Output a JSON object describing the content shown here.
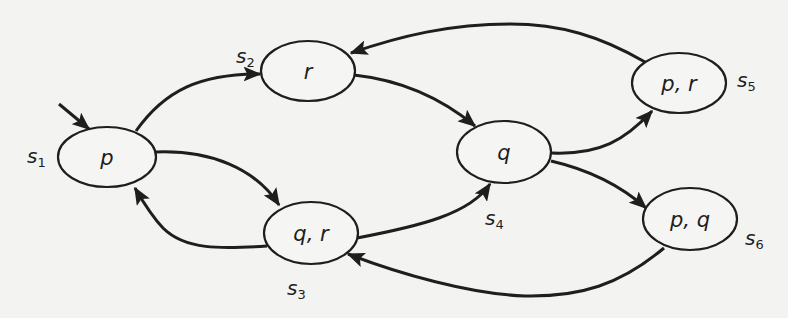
{
  "diagram": {
    "type": "kripke-structure",
    "colors": {
      "background": "#f3f3f1",
      "stroke": "#1e1e1e",
      "node_fill": "#f5f5f3"
    },
    "initial_state": "s1",
    "states": [
      {
        "id": "s1",
        "name": "s",
        "index": "1",
        "props": "p",
        "cx": 107,
        "cy": 157,
        "rx": 49,
        "ry": 30,
        "label_x": 27,
        "label_y": 163
      },
      {
        "id": "s2",
        "name": "s",
        "index": "2",
        "props": "r",
        "cx": 308,
        "cy": 71,
        "rx": 47,
        "ry": 30,
        "label_x": 236,
        "label_y": 64
      },
      {
        "id": "s3",
        "name": "s",
        "index": "3",
        "props": "q, r",
        "cx": 311,
        "cy": 233,
        "rx": 47,
        "ry": 31,
        "label_x": 287,
        "label_y": 297
      },
      {
        "id": "s4",
        "name": "s",
        "index": "4",
        "props": "q",
        "cx": 504,
        "cy": 152,
        "rx": 47,
        "ry": 31,
        "label_x": 485,
        "label_y": 227
      },
      {
        "id": "s5",
        "name": "s",
        "index": "5",
        "props": "p, r",
        "cx": 679,
        "cy": 83,
        "rx": 47,
        "ry": 30,
        "label_x": 737,
        "label_y": 89
      },
      {
        "id": "s6",
        "name": "s",
        "index": "6",
        "props": "p, q",
        "cx": 690,
        "cy": 219,
        "rx": 47,
        "ry": 31,
        "label_x": 745,
        "label_y": 247
      }
    ],
    "transitions": [
      {
        "from": "s1",
        "to": "s2"
      },
      {
        "from": "s1",
        "to": "s3"
      },
      {
        "from": "s2",
        "to": "s4"
      },
      {
        "from": "s3",
        "to": "s1"
      },
      {
        "from": "s3",
        "to": "s4"
      },
      {
        "from": "s4",
        "to": "s5"
      },
      {
        "from": "s4",
        "to": "s6"
      },
      {
        "from": "s5",
        "to": "s2"
      },
      {
        "from": "s6",
        "to": "s3"
      }
    ]
  }
}
